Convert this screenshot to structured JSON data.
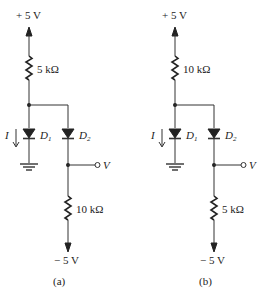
{
  "figure": {
    "circuits": [
      {
        "id": "a",
        "caption": "(a)",
        "supply_top": "+ 5 V",
        "supply_bottom": "− 5 V",
        "top_resistor": "5 kΩ",
        "bottom_resistor": "10 kΩ",
        "current_label": "I",
        "diode1": {
          "name": "D",
          "sub": "1"
        },
        "diode2": {
          "name": "D",
          "sub": "2"
        },
        "output_label": "V"
      },
      {
        "id": "b",
        "caption": "(b)",
        "supply_top": "+ 5 V",
        "supply_bottom": "− 5 V",
        "top_resistor": "10 kΩ",
        "bottom_resistor": "5 kΩ",
        "current_label": "I",
        "diode1": {
          "name": "D",
          "sub": "1"
        },
        "diode2": {
          "name": "D",
          "sub": "2"
        },
        "output_label": "V"
      }
    ]
  }
}
